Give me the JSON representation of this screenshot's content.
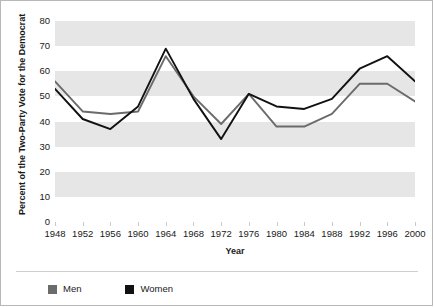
{
  "chart_data": {
    "type": "line",
    "title": "",
    "xlabel": "Year",
    "ylabel": "Percent of the Two-Party Vote for the Democrat",
    "x": [
      1948,
      1952,
      1956,
      1960,
      1964,
      1968,
      1972,
      1976,
      1980,
      1984,
      1988,
      1992,
      1996,
      2000
    ],
    "categories": [
      "1948",
      "1952",
      "1956",
      "1960",
      "1964",
      "1968",
      "1972",
      "1976",
      "1980",
      "1984",
      "1988",
      "1992",
      "1996",
      "2000"
    ],
    "series": [
      {
        "name": "Men",
        "color": "#6b6b6b",
        "values": [
          56,
          44,
          43,
          44,
          66,
          50,
          39,
          51,
          38,
          38,
          43,
          55,
          55,
          48
        ]
      },
      {
        "name": "Women",
        "color": "#111111",
        "values": [
          53,
          41,
          37,
          46,
          69,
          49,
          33,
          51,
          46,
          45,
          49,
          61,
          66,
          56
        ]
      }
    ],
    "xlim": [
      1948,
      2000
    ],
    "ylim": [
      0,
      80
    ],
    "yticks": [
      0,
      10,
      20,
      30,
      40,
      50,
      60,
      70,
      80
    ],
    "ytick_labels": [
      "0",
      "10",
      "20",
      "30",
      "40",
      "50",
      "60",
      "70",
      "80"
    ],
    "grid": "horizontal-bands",
    "band_color": "#e6e6e6",
    "legend_position": "bottom-left"
  },
  "legend": {
    "entries": [
      {
        "label": "Men",
        "color": "#6b6b6b"
      },
      {
        "label": "Women",
        "color": "#111111"
      }
    ]
  },
  "axes": {
    "x_title": "Year",
    "y_title": "Percent of the Two-Party Vote for the Democrat"
  }
}
